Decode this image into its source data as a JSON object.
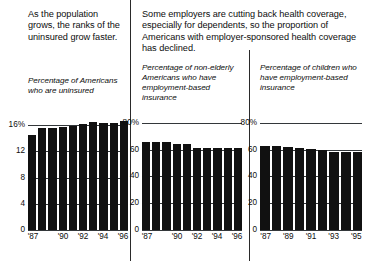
{
  "left_panel": {
    "headline": "As the population grows, the ranks of the uninsured grow faster.",
    "subtitle": "Percentage of Americans who are uninsured"
  },
  "right_panel": {
    "headline": "Some employers are cutting back health coverage, especially for dependents, so the proportion of Americans with employer-sponsored health coverage has declined.",
    "subtitle_left": "Percentage of non-elderly Americans who have employment-based insurance",
    "subtitle_right": "Percentage of children who have employment-based insurance"
  },
  "chart_data": [
    {
      "id": "uninsured",
      "type": "bar",
      "title": "Percentage of Americans who are uninsured",
      "xlabel": "",
      "ylabel": "",
      "categories": [
        "'87",
        "'88",
        "'89",
        "'90",
        "'91",
        "'92",
        "'93",
        "'94",
        "'95",
        "'96"
      ],
      "tick_labels": [
        "'87",
        "",
        "",
        "'90",
        "",
        "'92",
        "",
        "'94",
        "",
        "'96"
      ],
      "values": [
        14.5,
        15.6,
        15.6,
        15.7,
        15.9,
        16.2,
        16.5,
        16.4,
        16.4,
        16.7
      ],
      "yticks": [
        0,
        4,
        8,
        12,
        16
      ],
      "ytick_labels": [
        "0",
        "4",
        "8",
        "12",
        "16%"
      ],
      "ylim": [
        0,
        18
      ],
      "grid": true
    },
    {
      "id": "nonelderly-employment-based",
      "type": "bar",
      "title": "Percentage of non-elderly Americans who have employment-based insurance",
      "xlabel": "",
      "ylabel": "",
      "categories": [
        "'87",
        "'88",
        "'89",
        "'90",
        "'91",
        "'92",
        "'93",
        "'94",
        "'95",
        "'96"
      ],
      "tick_labels": [
        "'87",
        "",
        "",
        "'90",
        "",
        "'92",
        "",
        "'94",
        "",
        "'96"
      ],
      "values": [
        66,
        65.5,
        65.3,
        64.5,
        64.3,
        61.5,
        61.3,
        61.2,
        61.2,
        61.0
      ],
      "yticks": [
        0,
        20,
        40,
        60,
        80
      ],
      "ytick_labels": [
        "0",
        "20",
        "40",
        "60",
        "80%"
      ],
      "ylim": [
        0,
        88
      ],
      "grid": true
    },
    {
      "id": "children-employment-based",
      "type": "bar",
      "title": "Percentage of children who have employment-based insurance",
      "xlabel": "",
      "ylabel": "",
      "categories": [
        "'87",
        "'88",
        "'89",
        "'90",
        "'91",
        "'92",
        "'93",
        "'94",
        "'95"
      ],
      "tick_labels": [
        "'87",
        "",
        "'89",
        "",
        "'91",
        "",
        "'93",
        "",
        "'95"
      ],
      "values": [
        63,
        63,
        62,
        61,
        60.5,
        60,
        58,
        58,
        58
      ],
      "yticks": [
        0,
        20,
        40,
        60,
        80
      ],
      "ytick_labels": [
        "0",
        "20",
        "40",
        "60",
        "80%"
      ],
      "ylim": [
        0,
        88
      ],
      "grid": true
    }
  ],
  "colors": {
    "bar": "#111111",
    "axis": "#33373a",
    "text": "#0d0d0d",
    "background": "#ffffff"
  }
}
